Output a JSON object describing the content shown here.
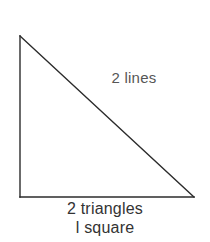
{
  "canvas": {
    "width": 210,
    "height": 242,
    "background_color": "#ffffff"
  },
  "figure": {
    "shape_name": "right-triangle",
    "stroke_color": "#2b2b2b",
    "stroke_width": 1.4,
    "fill": "none",
    "vertices": {
      "apex_top_left": [
        20,
        36
      ],
      "corner_bottom_left": [
        20,
        197
      ],
      "corner_bottom_right": [
        194,
        197
      ]
    },
    "edges": [
      {
        "name": "vertical-leg",
        "from": [
          20,
          36
        ],
        "to": [
          20,
          197
        ]
      },
      {
        "name": "horizontal-base",
        "from": [
          20,
          197
        ],
        "to": [
          194,
          197
        ]
      },
      {
        "name": "hypotenuse",
        "from": [
          20,
          36
        ],
        "to": [
          194,
          197
        ]
      }
    ]
  },
  "labels": {
    "hypotenuse_label": "2 lines",
    "hypotenuse_label_color": "#565656",
    "caption_line_1": "2 triangles",
    "caption_line_2": "l square",
    "caption_color": "#333333"
  }
}
